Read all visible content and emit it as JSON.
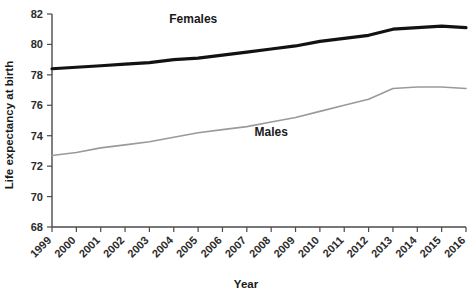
{
  "chart_data": {
    "type": "line",
    "title": "",
    "xlabel": "Year",
    "ylabel": "Life expectancy at birth",
    "categories": [
      "1999",
      "2000",
      "2001",
      "2002",
      "2003",
      "2004",
      "2005",
      "2006",
      "2007",
      "2008",
      "2009",
      "2010",
      "2011",
      "2012",
      "2013",
      "2014",
      "2015",
      "2016"
    ],
    "x": [
      1999,
      2000,
      2001,
      2002,
      2003,
      2004,
      2005,
      2006,
      2007,
      2008,
      2009,
      2010,
      2011,
      2012,
      2013,
      2014,
      2015,
      2016
    ],
    "xlim": [
      1999,
      2016
    ],
    "ylim": [
      68,
      82
    ],
    "yticks": [
      68,
      70,
      72,
      74,
      76,
      78,
      80,
      82
    ],
    "ytick_labels": [
      "68",
      "70",
      "72",
      "74",
      "76",
      "78",
      "80",
      "82"
    ],
    "grid": false,
    "legend_position": "inline-annotation",
    "series": [
      {
        "name": "Females",
        "color": "#121212",
        "values": [
          78.4,
          78.5,
          78.6,
          78.7,
          78.8,
          79.0,
          79.1,
          79.3,
          79.5,
          79.7,
          79.9,
          80.2,
          80.4,
          80.6,
          81.0,
          81.1,
          81.2,
          81.1
        ]
      },
      {
        "name": "Males",
        "color": "#9a9a9a",
        "values": [
          72.7,
          72.9,
          73.2,
          73.4,
          73.6,
          73.9,
          74.2,
          74.4,
          74.6,
          74.9,
          75.2,
          75.6,
          76.0,
          76.4,
          77.1,
          77.2,
          77.2,
          77.1
        ]
      }
    ],
    "annotations": [
      {
        "text": "Females",
        "x": 2004.8,
        "y": 81.4
      },
      {
        "text": "Males",
        "x": 2008.0,
        "y": 74.0
      }
    ]
  }
}
